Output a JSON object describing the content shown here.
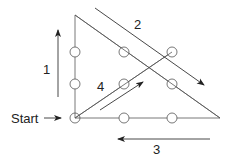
{
  "labels": {
    "start": "Start",
    "step1": "1",
    "step2": "2",
    "step3": "3",
    "step4": "4"
  },
  "dots": [
    {
      "x": 75,
      "y": 52
    },
    {
      "x": 124,
      "y": 52
    },
    {
      "x": 172,
      "y": 52
    },
    {
      "x": 75,
      "y": 84
    },
    {
      "x": 124,
      "y": 84
    },
    {
      "x": 172,
      "y": 84
    },
    {
      "x": 75,
      "y": 118
    },
    {
      "x": 124,
      "y": 118
    },
    {
      "x": 172,
      "y": 118
    }
  ],
  "colors": {
    "line": "#444444",
    "text": "#222222"
  }
}
